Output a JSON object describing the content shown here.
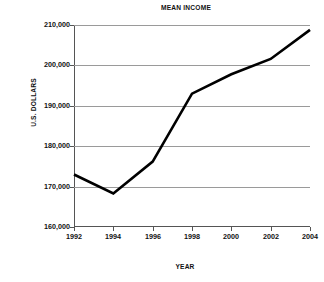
{
  "chart_data": {
    "type": "line",
    "title": "MEAN INCOME",
    "xlabel": "YEAR",
    "ylabel": "U.S. DOLLARS",
    "x": [
      1992,
      1994,
      1996,
      1998,
      2000,
      2002,
      2004
    ],
    "xtick_labels": [
      "1992",
      "1994",
      "1996",
      "1998",
      "2000",
      "2002",
      "2004"
    ],
    "values": [
      173000,
      168300,
      176200,
      193000,
      197800,
      201600,
      208800
    ],
    "series": [
      {
        "name": "Mean income",
        "values": [
          173000,
          168300,
          176200,
          193000,
          197800,
          201600,
          208800
        ]
      }
    ],
    "ylim": [
      160000,
      210000
    ],
    "xlim": [
      1992,
      2004
    ],
    "ytick_values": [
      160000,
      170000,
      180000,
      190000,
      200000,
      210000
    ],
    "ytick_labels": [
      "160,000",
      "170,000",
      "180,000",
      "190,000",
      "200,000",
      "210,000"
    ],
    "grid": true,
    "legend": "none",
    "line_color": "#000000",
    "grid_color": "#9a9a9a",
    "axis_color": "#555555",
    "background_color": "#ffffff"
  }
}
